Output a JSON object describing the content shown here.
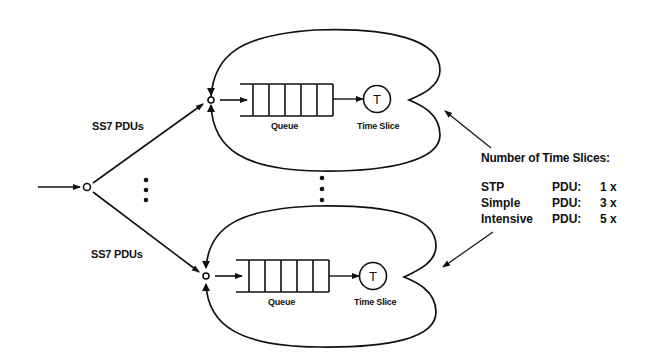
{
  "diagram": {
    "input_labels": {
      "upper": "SS7 PDUs",
      "lower": "SS7 PDUs"
    },
    "servers": [
      {
        "queue_label": "Queue",
        "timer_symbol": "T",
        "timer_label": "Time Slice"
      },
      {
        "queue_label": "Queue",
        "timer_symbol": "T",
        "timer_label": "Time Slice"
      }
    ],
    "legend": {
      "title": "Number of Time Slices:",
      "rows": [
        {
          "type": "STP",
          "unit": "PDU:",
          "count": "1 x"
        },
        {
          "type": "Simple",
          "unit": "PDU:",
          "count": "3 x"
        },
        {
          "type": "Intensive",
          "unit": "PDU:",
          "count": "5 x"
        }
      ]
    },
    "colors": {
      "stroke": "#111111",
      "background": "#ffffff"
    }
  }
}
